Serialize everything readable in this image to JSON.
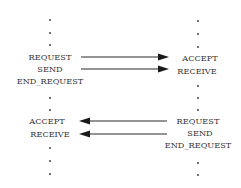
{
  "diagram": {
    "type": "message-sequence",
    "left_process": {
      "top_dots": 3,
      "block_top": [
        "REQUEST",
        "SEND",
        "END_REQUEST"
      ],
      "middle_dots": 2,
      "block_bottom": [
        "ACCEPT",
        "RECEIVE"
      ],
      "bottom_dots": 3
    },
    "right_process": {
      "top_dots": 3,
      "block_top": [
        "ACCEPT",
        "RECEIVE"
      ],
      "middle_dots": 3,
      "block_bottom": [
        "REQUEST",
        "SEND",
        "END_REQUEST"
      ],
      "bottom_dots": 2
    },
    "arrows": [
      {
        "from": "left.REQUEST",
        "to": "right.ACCEPT",
        "direction": "left-to-right"
      },
      {
        "from": "left.SEND",
        "to": "right.RECEIVE",
        "direction": "left-to-right"
      },
      {
        "from": "right.REQUEST",
        "to": "left.ACCEPT",
        "direction": "right-to-left"
      },
      {
        "from": "right.SEND",
        "to": "left.RECEIVE",
        "direction": "right-to-left"
      }
    ],
    "colors": {
      "ink": "#333333",
      "background": "#ffffff"
    }
  }
}
